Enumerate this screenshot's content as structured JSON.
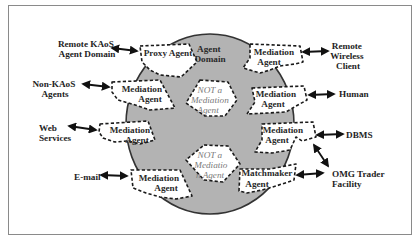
{
  "diagram": {
    "domain": {
      "label": [
        "Agent",
        "Domain"
      ],
      "fill_color": "#b3b3b3",
      "border_color": "#333333"
    },
    "internal_agents": [
      {
        "id": "proxy",
        "label": [
          "Proxy Agent"
        ]
      },
      {
        "id": "med-wireless",
        "label": [
          "Mediation",
          "Agent"
        ]
      },
      {
        "id": "med-nonkaos",
        "label": [
          "Mediation",
          "Agent"
        ]
      },
      {
        "id": "med-human",
        "label": [
          "Mediation",
          "Agent"
        ]
      },
      {
        "id": "med-web",
        "label": [
          "Mediation",
          "Agent"
        ]
      },
      {
        "id": "med-dbms",
        "label": [
          "Mediation",
          "Agent"
        ]
      },
      {
        "id": "med-email",
        "label": [
          "Mediation",
          "Agent"
        ]
      },
      {
        "id": "matchmaker",
        "label": [
          "Matchmaker",
          "Agent"
        ]
      }
    ],
    "non_mediation_agents": [
      {
        "id": "not-med-1",
        "label": [
          "NOT a",
          "Mediation",
          "Agent"
        ]
      },
      {
        "id": "not-med-2",
        "label": [
          "NOT a",
          "Mediatio",
          "n Agent"
        ]
      }
    ],
    "external_entities": [
      {
        "id": "remote-kaos",
        "label": [
          "Remote KAoS",
          "Agent Domain"
        ],
        "connects_to": "proxy"
      },
      {
        "id": "non-kaos",
        "label": [
          "Non-KAoS",
          "Agents"
        ],
        "connects_to": "med-nonkaos"
      },
      {
        "id": "web-services",
        "label": [
          "Web",
          "Services"
        ],
        "connects_to": "med-web"
      },
      {
        "id": "email",
        "label": [
          "E-mail"
        ],
        "connects_to": "med-email"
      },
      {
        "id": "remote-wireless",
        "label": [
          "Remote",
          "Wireless",
          "Client"
        ],
        "connects_to": "med-wireless"
      },
      {
        "id": "human",
        "label": [
          "Human"
        ],
        "connects_to": "med-human"
      },
      {
        "id": "dbms",
        "label": [
          "DBMS"
        ],
        "connects_to": "med-dbms"
      },
      {
        "id": "omg-trader",
        "label": [
          "OMG Trader",
          "Facility"
        ],
        "connects_to": [
          "med-dbms",
          "matchmaker"
        ]
      }
    ],
    "connector_style": "bidirectional-arrow"
  }
}
